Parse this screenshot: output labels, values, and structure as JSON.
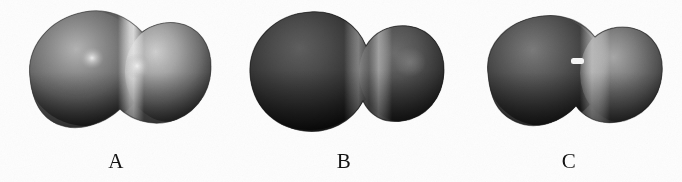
{
  "figure": {
    "type": "scientific-figure",
    "background_color": "#fdfdfd",
    "caption_color": "#131313",
    "panel_count": 3
  },
  "panels": [
    {
      "id": "panel-a",
      "label": "A",
      "shape_name": "pear-shaped-binary-configuration",
      "outline_description": "Large left lobe joined to a smaller, slightly elevated right lobe with shallow neck",
      "tilt_deg": -8,
      "colors": {
        "highlight": "#d8d8d8",
        "mid": "#8c8c8c",
        "shadow": "#2a2a2a",
        "rim": "#171717"
      },
      "specular_spots": 2,
      "neck_band": "bright-vertical-band"
    },
    {
      "id": "panel-b",
      "label": "B",
      "shape_name": "dumbbell-binary-configuration",
      "outline_description": "Two nearly equal dark spheres joined by a pronounced narrow neck",
      "tilt_deg": 0,
      "colors": {
        "highlight": "#9a9a9a",
        "mid": "#4a4a4a",
        "shadow": "#161616",
        "rim": "#0d0d0d"
      },
      "specular_spots": 1,
      "neck_band": "bright-vertical-band"
    },
    {
      "id": "panel-c",
      "label": "C",
      "shape_name": "bean-shaped-scission-configuration",
      "outline_description": "Compact rounded bean with indented lower edge and bright vertical band right of centre",
      "tilt_deg": -6,
      "colors": {
        "highlight": "#bdbdbd",
        "mid": "#676767",
        "shadow": "#1d1d1d",
        "rim": "#121212"
      },
      "specular_spots": 1,
      "neck_band": "bright-vertical-band"
    }
  ],
  "labels": {
    "a": "A",
    "b": "B",
    "c": "C"
  }
}
